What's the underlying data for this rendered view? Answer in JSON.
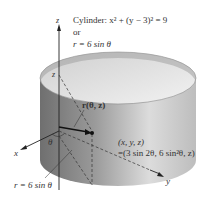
{
  "diagram": {
    "title_line1": "Cylinder: x² + (y − 3)² = 9",
    "title_line2": "or",
    "title_line3": "r = 6 sin θ",
    "axis_x": "x",
    "axis_y": "y",
    "axis_z": "z",
    "z_height_label": "z",
    "vector_label": "r(θ, z)",
    "angle_label": "θ",
    "point_label_line1": "(x, y, z)",
    "point_label_line2": "=(3 sin 2θ, 6 sin²θ, z)",
    "radius_label": "r = 6 sin θ",
    "colors": {
      "cylinder_outer_dark": "#7a7a7a",
      "cylinder_outer_light": "#d9d9d9",
      "cylinder_inner": "#e6e6e6",
      "axis": "#222222"
    }
  }
}
